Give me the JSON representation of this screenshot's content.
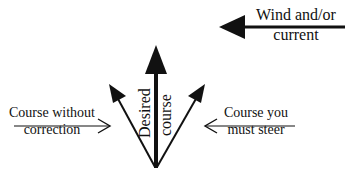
{
  "diagram": {
    "labels": {
      "wind": [
        "Wind and/or",
        "current"
      ],
      "desired": [
        "Desired",
        "course"
      ],
      "without_correction": [
        "Course without",
        "correction"
      ],
      "must_steer": [
        "Course you",
        "must steer"
      ]
    },
    "colors": {
      "ink": "#111111",
      "background": "#ffffff"
    }
  }
}
